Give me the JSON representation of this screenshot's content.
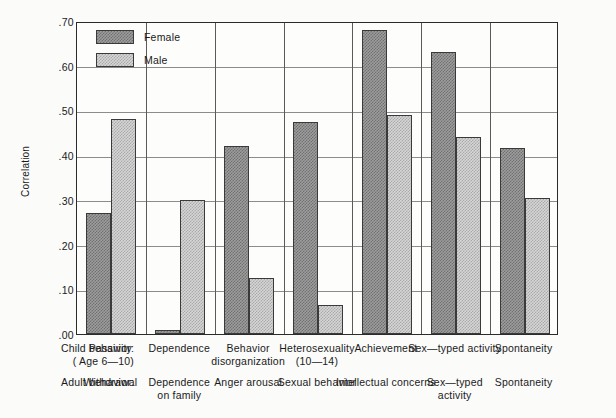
{
  "chart_data": {
    "type": "bar",
    "title": "",
    "xlabel": "",
    "ylabel": "Correlation",
    "ylim": [
      0.0,
      0.7
    ],
    "ytick_labels": [
      ".70",
      ".60",
      ".50",
      ".40",
      ".30",
      ".20",
      ".10",
      ".00"
    ],
    "ytick_values": [
      0.7,
      0.6,
      0.5,
      0.4,
      0.3,
      0.2,
      0.1,
      0.0
    ],
    "grid": true,
    "legend_position": "top-left",
    "categories": [
      "Passivity",
      "Dependence",
      "Behavior disorganization",
      "Heterosexuality (10-14)",
      "Achievement",
      "Sex-typed activity",
      "Spontaneity"
    ],
    "series": [
      {
        "name": "Female",
        "values": [
          0.27,
          0.01,
          0.42,
          0.475,
          0.68,
          0.63,
          0.415
        ]
      },
      {
        "name": "Male",
        "values": [
          0.48,
          0.3,
          0.125,
          0.065,
          0.49,
          0.44,
          0.305
        ]
      }
    ]
  },
  "legend": {
    "items": [
      {
        "label": "Female",
        "pattern": "dense-hatch-dark"
      },
      {
        "label": "Male",
        "pattern": "light-hatch"
      }
    ]
  },
  "axis": {
    "y_title": "Correlation",
    "ticks": [
      ".70",
      ".60",
      ".50",
      ".40",
      ".30",
      ".20",
      ".10",
      ".00"
    ]
  },
  "xlabels": {
    "child_row_title_line1": "Child behavior:",
    "child_row_title_line2": "( Age 6—10)",
    "adult_row_title": "Adult behavior:",
    "child": [
      {
        "line1": "Passivity",
        "line2": ""
      },
      {
        "line1": "Dependence",
        "line2": ""
      },
      {
        "line1": "Behavior",
        "line2": "disorganization"
      },
      {
        "line1": "Heterosexuality",
        "line2": "(10—14)"
      },
      {
        "line1": "Achievement",
        "line2": ""
      },
      {
        "line1": "Sex—typed activity",
        "line2": ""
      },
      {
        "line1": "Spontaneity",
        "line2": ""
      }
    ],
    "adult": [
      {
        "line1": "Withdrawal",
        "line2": ""
      },
      {
        "line1": "Dependence",
        "line2": "on family"
      },
      {
        "line1": "Anger arousal",
        "line2": ""
      },
      {
        "line1": "Sexual behavior",
        "line2": ""
      },
      {
        "line1": "Intellectual concerns",
        "line2": ""
      },
      {
        "line1": "Sex—typed",
        "line2": "activity"
      },
      {
        "line1": "Spontaneity",
        "line2": ""
      }
    ]
  },
  "colors": {
    "frame": "#2b2b2b",
    "gridline": "#8c8c8c",
    "female_fill": "#9d9d9d",
    "male_fill": "#d6d6d6",
    "background": "#fbfbfa"
  }
}
